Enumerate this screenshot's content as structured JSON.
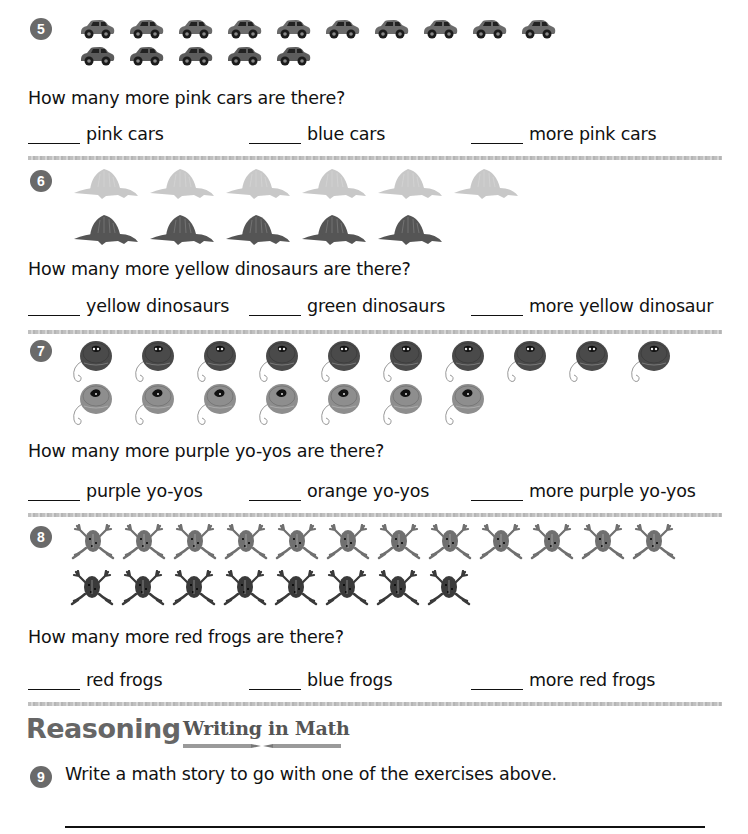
{
  "colors": {
    "badge": "#6a6a6a",
    "pink_car": "#6b6b6b",
    "blue_car": "#5c5c5c",
    "yellow_dino": "#c8c8c8",
    "green_dino": "#555555",
    "purple_yoyo": "#4a4a4a",
    "orange_yoyo": "#8e8e8e",
    "red_frog": "#707070",
    "blue_frog": "#3a3a3a",
    "separator": "#b5b5b5",
    "heading": "#666666"
  },
  "exercises": [
    {
      "number": "5",
      "row1": {
        "name": "pink cars",
        "count": 10,
        "icon": "car-icon"
      },
      "row2": {
        "name": "blue cars",
        "count": 5,
        "icon": "car-icon"
      },
      "question": "How many more pink cars are there?",
      "answers": [
        "pink cars",
        "blue cars",
        "more pink cars"
      ]
    },
    {
      "number": "6",
      "row1": {
        "name": "yellow dinosaurs",
        "count": 6,
        "icon": "dinosaur-icon"
      },
      "row2": {
        "name": "green dinosaurs",
        "count": 5,
        "icon": "dinosaur-icon"
      },
      "question": "How many more yellow dinosaurs are there?",
      "answers": [
        "yellow dinosaurs",
        "green dinosaurs",
        "more yellow dinosaur"
      ]
    },
    {
      "number": "7",
      "row1": {
        "name": "purple yo-yos",
        "count": 10,
        "icon": "yoyo-icon"
      },
      "row2": {
        "name": "orange yo-yos",
        "count": 7,
        "icon": "yoyo-icon"
      },
      "question": "How many more purple yo-yos are there?",
      "answers": [
        "purple yo-yos",
        "orange yo-yos",
        "more purple yo-yos"
      ]
    },
    {
      "number": "8",
      "row1": {
        "name": "red frogs",
        "count": 12,
        "icon": "frog-icon"
      },
      "row2": {
        "name": "blue frogs",
        "count": 8,
        "icon": "frog-icon"
      },
      "question": "How many more red frogs are there?",
      "answers": [
        "red frogs",
        "blue frogs",
        "more red frogs"
      ]
    }
  ],
  "reasoning": {
    "heading": "Reasoning",
    "subheading": "Writing in Math",
    "number": "9",
    "prompt": "Write a math story to go with one of the exercises above."
  }
}
